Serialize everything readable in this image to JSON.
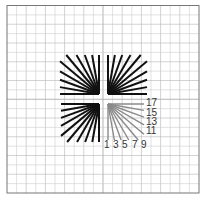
{
  "chart_data": {
    "type": "diagram",
    "title": "",
    "grid": {
      "on": true,
      "cols": 20,
      "rows": 20,
      "color": "#cfcfcf",
      "major_color": "#b5b5b5",
      "frame_color": "#777777"
    },
    "quadrants": [
      {
        "name": "top-left",
        "color": "#111111",
        "line_count": 10,
        "angles_deg": [
          0,
          10,
          20,
          30,
          40,
          50,
          60,
          70,
          80,
          90
        ]
      },
      {
        "name": "top-right",
        "color": "#111111",
        "line_count": 10,
        "angles_deg": [
          0,
          10,
          20,
          30,
          40,
          50,
          60,
          70,
          80,
          90
        ]
      },
      {
        "name": "bottom-left",
        "color": "#111111",
        "line_count": 10,
        "angles_deg": [
          0,
          10,
          20,
          30,
          40,
          50,
          60,
          70,
          80,
          90
        ]
      },
      {
        "name": "bottom-right",
        "color": "#8a8a8a",
        "line_count": 10,
        "angles_deg": [
          0,
          10,
          20,
          30,
          40,
          50,
          60,
          70,
          80,
          90
        ]
      }
    ],
    "bottom_labels": [
      "1",
      "3",
      "5",
      "7",
      "9"
    ],
    "right_labels": [
      "17",
      "15",
      "13",
      "11"
    ]
  },
  "labels": {
    "bottom": [
      "1",
      "3",
      "5",
      "7",
      "9"
    ],
    "right": [
      "17",
      "15",
      "13",
      "11"
    ]
  }
}
